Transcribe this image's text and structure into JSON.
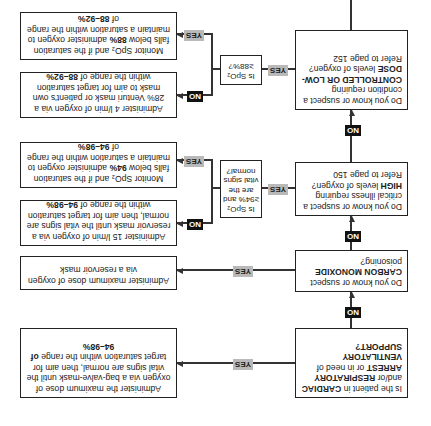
{
  "diagram": {
    "orientation": "rotated 180 degrees",
    "decisions": [
      {
        "pre": "Is the patient in ",
        "b1": "CARDIAC",
        "mid1": " and/or ",
        "b2": "RESPIRATORY ARREST",
        "mid2": " or in need of ",
        "b3": "VENTILATORY SUPPORT?"
      },
      {
        "pre": "Do you know or suspect ",
        "b1": "CARBON MONOXIDE",
        "post": " poisoning?"
      },
      {
        "pre": "Do you know or suspect a critical illness requiring ",
        "b1": "HIGH",
        "post": " levels of oxygen? ",
        "ref": "Refer to page 150"
      },
      {
        "pre": "Do you know or suspect a condition requiring ",
        "b1": "CONTROLLED OR LOW-DOSE",
        "post": " levels of oxygen? ",
        "ref": "Refer to page 152"
      }
    ],
    "actions": {
      "cardiac_yes": {
        "text": "Administer the maximum dose of oxygen via a bag-valve-mask until the vital signs are normal, then aim for target saturation within the range ",
        "bold": "of 94–98%"
      },
      "co_yes": {
        "text": "Administer maximum dose of oxygen via a reservoir mask"
      },
      "high_no": {
        "text": "Administer 15 l/min of oxygen via a reservoir mask until the vital signs are normal, then aim for target saturation within the range of ",
        "bold": "94–98%"
      },
      "high_yes": {
        "text1": "Monitor SpO₂ and if the saturation falls below ",
        "bold1": "94%",
        "text2": " administer oxygen to maintain a saturation within the range of ",
        "bold2": "94–98%"
      },
      "low_no": {
        "text": "Administer 4 l/min of oxygen via a 28% Venturi mask or patient's own mask to aim for target saturation within the range of ",
        "bold": "88–92%"
      },
      "low_yes": {
        "text1": "Monitor SpO₂ and if the saturation falls below ",
        "bold1": "88%",
        "text2": " administer oxygen to maintain a saturation within the range of ",
        "bold2": "88–92%"
      }
    },
    "checks": {
      "high": "Is SpO₂ ≥94% and are the vital signs normal?",
      "low": "Is SpO₂ ≥88%?"
    },
    "labels": {
      "yes": "YES",
      "no": "NO"
    },
    "colors": {
      "yes_badge": "#b9b9b9",
      "no_badge": "#111111",
      "line": "#333333"
    }
  }
}
